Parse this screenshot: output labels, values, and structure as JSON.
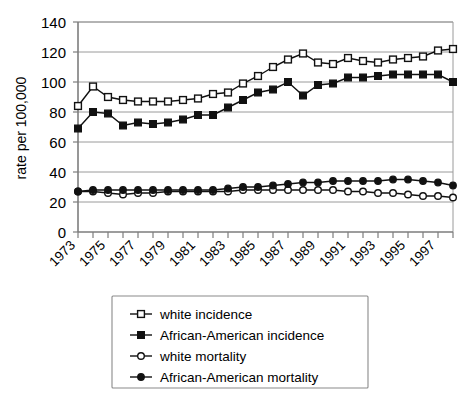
{
  "chart_data": {
    "type": "line",
    "title": "",
    "subtitle": "",
    "xlabel": "",
    "ylabel": "rate per 100,000",
    "xlim": [
      1973,
      1998
    ],
    "ylim": [
      0,
      140
    ],
    "yticks": [
      0,
      20,
      40,
      60,
      80,
      100,
      120,
      140
    ],
    "grid": true,
    "grid_axis": "y",
    "legend_position": "bottom",
    "x": [
      1973,
      1974,
      1975,
      1976,
      1977,
      1978,
      1979,
      1980,
      1981,
      1982,
      1983,
      1984,
      1985,
      1986,
      1987,
      1988,
      1989,
      1990,
      1991,
      1992,
      1993,
      1994,
      1995,
      1996,
      1997,
      1998
    ],
    "xtick_labels": [
      "1973",
      "1975",
      "1977",
      "1979",
      "1981",
      "1983",
      "1985",
      "1987",
      "1989",
      "1991",
      "1993",
      "1995",
      "1997"
    ],
    "xtick_values": [
      1973,
      1975,
      1977,
      1979,
      1981,
      1983,
      1985,
      1987,
      1989,
      1991,
      1993,
      1995,
      1997
    ],
    "series": [
      {
        "name": "white incidence",
        "marker": "open-square",
        "values": [
          84,
          97,
          90,
          88,
          87,
          87,
          87,
          88,
          89,
          92,
          93,
          99,
          104,
          110,
          115,
          119,
          113,
          112,
          116,
          114,
          113,
          115,
          116,
          117,
          121,
          122
        ]
      },
      {
        "name": "African-American incidence",
        "marker": "filled-square",
        "values": [
          69,
          80,
          79,
          71,
          73,
          72,
          73,
          75,
          78,
          78,
          83,
          88,
          93,
          95,
          100,
          91,
          98,
          99,
          103,
          103,
          104,
          105,
          105,
          105,
          105,
          100
        ]
      },
      {
        "name": "white mortality",
        "marker": "open-circle",
        "values": [
          27,
          27,
          26,
          25,
          26,
          26,
          27,
          27,
          27,
          27,
          27,
          28,
          28,
          28,
          28,
          28,
          28,
          28,
          27,
          27,
          26,
          26,
          25,
          24,
          24,
          23
        ]
      },
      {
        "name": "African-American mortality",
        "marker": "filled-circle",
        "values": [
          27,
          28,
          28,
          28,
          28,
          28,
          28,
          28,
          28,
          28,
          29,
          30,
          30,
          31,
          32,
          33,
          33,
          34,
          34,
          34,
          34,
          35,
          35,
          34,
          33,
          31
        ]
      }
    ]
  },
  "legend": {
    "items": [
      {
        "label": "white incidence",
        "marker": "open-square"
      },
      {
        "label": "African-American incidence",
        "marker": "filled-square"
      },
      {
        "label": "white mortality",
        "marker": "open-circle"
      },
      {
        "label": "African-American mortality",
        "marker": "filled-circle"
      }
    ]
  },
  "colors": {
    "line": "#111111",
    "grid": "#9a9a9a",
    "axis": "#7d7d7d",
    "background": "#ffffff",
    "marker_fill_open": "#ffffff",
    "marker_fill_solid": "#111111"
  }
}
